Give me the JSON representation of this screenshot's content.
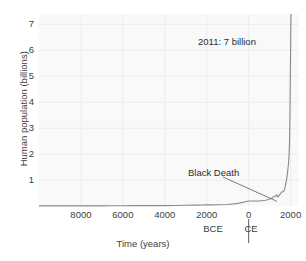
{
  "figure": {
    "background_color": "#f9f9f9",
    "grid_color": "#ececec",
    "line_color": "#8a8a8a",
    "text_color": "#3a3a3a"
  },
  "chart_data": {
    "type": "line",
    "title": "",
    "xlabel": "Time (years)",
    "ylabel": "Human population (billions)",
    "xlim": [
      -10000,
      2400
    ],
    "ylim": [
      0,
      7.4
    ],
    "grid": true,
    "legend": null,
    "x_tick_labels": [
      "8000",
      "6000",
      "4000",
      "2000",
      "0",
      "2000"
    ],
    "x_tick_values": [
      -8000,
      -6000,
      -4000,
      -2000,
      0,
      2000
    ],
    "y_tick_labels": [
      "1",
      "2",
      "3",
      "4",
      "5",
      "6",
      "7"
    ],
    "y_tick_values": [
      1,
      2,
      3,
      4,
      5,
      6,
      7
    ],
    "era_left_label": "BCE",
    "era_right_label": "CE",
    "era_divider_value": 0,
    "annotations": [
      {
        "id": "peak",
        "text": "2011: 7 billion",
        "x": 2011,
        "y": 7.0,
        "leader": false
      },
      {
        "id": "black-death",
        "text": "Black Death",
        "x": 1348,
        "y": 0.37,
        "leader": true,
        "leader_from": [
          -1230,
          1.12
        ],
        "leader_to": [
          1348,
          0.18
        ]
      }
    ],
    "series": [
      {
        "name": "World population",
        "x": [
          -10000,
          -9000,
          -8000,
          -7000,
          -6500,
          -6000,
          -5500,
          -5200,
          -5000,
          -4800,
          -4500,
          -4000,
          -3500,
          -3000,
          -2500,
          -2200,
          -2000,
          -1800,
          -1500,
          -1000,
          -500,
          0,
          200,
          400,
          500,
          600,
          700,
          800,
          900,
          1000,
          1100,
          1200,
          1300,
          1340,
          1348,
          1400,
          1500,
          1600,
          1650,
          1700,
          1750,
          1800,
          1850,
          1900,
          1927,
          1950,
          1960,
          1974,
          1987,
          1999,
          2011,
          2020
        ],
        "y": [
          0.004,
          0.004,
          0.005,
          0.006,
          0.007,
          0.009,
          0.014,
          0.018,
          0.015,
          0.013,
          0.013,
          0.014,
          0.02,
          0.027,
          0.035,
          0.04,
          0.05,
          0.045,
          0.05,
          0.06,
          0.1,
          0.19,
          0.19,
          0.19,
          0.19,
          0.2,
          0.21,
          0.22,
          0.24,
          0.27,
          0.3,
          0.36,
          0.4,
          0.44,
          0.37,
          0.35,
          0.46,
          0.55,
          0.55,
          0.6,
          0.79,
          0.98,
          1.26,
          1.65,
          2.0,
          2.5,
          3.0,
          4.0,
          5.0,
          6.0,
          7.0,
          7.4
        ]
      }
    ]
  }
}
